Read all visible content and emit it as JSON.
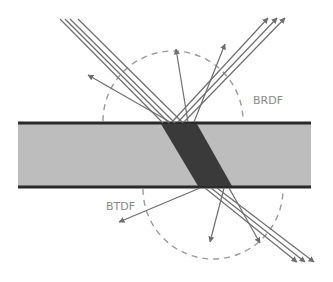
{
  "diagram": {
    "labels": {
      "brdf": "BRDF",
      "btdf": "BTDF"
    },
    "colors": {
      "background": "#ffffff",
      "slab_fill": "#bdbdbd",
      "slab_edge": "#2a2a2a",
      "refracted_beam": "#3a3a3a",
      "rays": "#6e6e6e",
      "lobe": "#9a9a9a",
      "label": "#8a8a8a"
    },
    "elements": {
      "incident_rays": 4,
      "specular_reflected_rays": 3,
      "diffuse_reflected_rays": 3,
      "specular_transmitted_rays": 3,
      "diffuse_transmitted_rays": 3
    }
  }
}
